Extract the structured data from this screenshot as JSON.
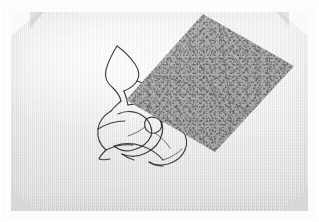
{
  "image": {
    "kind": "photograph",
    "subject": "hand-drawn ink line drawing on textured paper with a speckled grey overlay sheet",
    "width_px": 319,
    "height_px": 222,
    "alt_text": "A sheet of pale grey textured paper held by corner mounts, bearing a loose hand-drawn ink contour drawing, partly covered by a rotated rectangle of speckled grey paper."
  },
  "colors": {
    "page_background": "#fcfcfc",
    "paper_light": "#eceded",
    "paper_mid": "#e2e2e1",
    "paper_shadow": "#dedede",
    "ink_line": "#32302f",
    "overlay_grey": "#a3a3a2",
    "overlay_speckle_dark": "#3c3c3a",
    "overlay_speckle_light": "#ebebe9",
    "corner_mount_light": "#fafafa",
    "corner_mount_grey": "#d6d7d7"
  },
  "elements": {
    "paper_sheet": {
      "name": "paper sheet",
      "texture": "fine vertical linen weave"
    },
    "corner_mounts": [
      {
        "position": "top-left",
        "tone": "light"
      },
      {
        "position": "top-right",
        "tone": "light"
      },
      {
        "position": "bottom-left",
        "tone": "grey"
      },
      {
        "position": "bottom-right",
        "tone": "grey"
      }
    ],
    "ink_drawing": {
      "name": "ink contour drawing",
      "description": "pointed leaf-like fin at upper left joined to a cluster of nested spiral and petal curves below",
      "stroke_color": "#32302f",
      "bounding_box": {
        "x": 96,
        "y": 42,
        "width": 104,
        "height": 124
      }
    },
    "overlay_sheet": {
      "name": "speckled overlay sheet",
      "shape": "rotated rectangle (diamond orientation)",
      "fill": "#a3a3a2",
      "opacity": 0.93,
      "corners_px": [
        {
          "label": "top",
          "x": 203,
          "y": 14
        },
        {
          "label": "right",
          "x": 294,
          "y": 66
        },
        {
          "label": "bottom",
          "x": 215,
          "y": 152
        },
        {
          "label": "left",
          "x": 126,
          "y": 100
        }
      ],
      "surface": "dense dark and light speckle with faint diagonal creases"
    }
  }
}
